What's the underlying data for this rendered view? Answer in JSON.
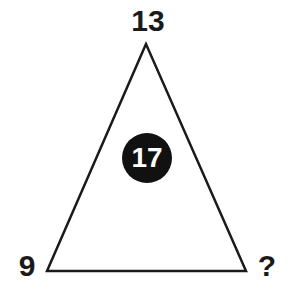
{
  "puzzle": {
    "top_value": "13",
    "left_value": "9",
    "right_value": "?",
    "center_value": "17"
  },
  "colors": {
    "line": "#1a1a1a",
    "circle": "#111111",
    "center_text": "#ffffff",
    "text": "#1a1a1a",
    "background": "#ffffff"
  }
}
